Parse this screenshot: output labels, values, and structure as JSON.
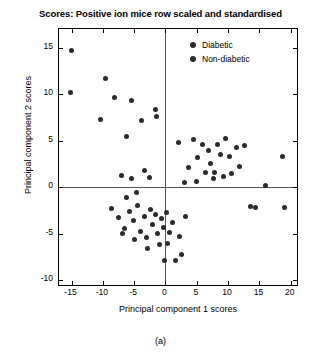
{
  "chart_data": {
    "type": "scatter",
    "title": "Scores: Positive ion mice row scaled and standardised",
    "xlabel": "Principal component 1 scores",
    "ylabel": "Principal component 2 scores",
    "xlim": [
      -17,
      21
    ],
    "ylim": [
      -10.5,
      17
    ],
    "xticks": [
      -15,
      -10,
      -5,
      0,
      5,
      10,
      15,
      20
    ],
    "yticks": [
      -10,
      -5,
      0,
      5,
      10,
      15
    ],
    "xticklabels": [
      "-15",
      "-10",
      "-5",
      "0",
      "5",
      "10",
      "15",
      "20"
    ],
    "yticklabels": [
      "-10",
      "-5",
      "0",
      "5",
      "10",
      "15"
    ],
    "grid": false,
    "reference_lines": {
      "x": 0,
      "y": 0
    },
    "legend": {
      "position": "top-right-inside",
      "entries": [
        {
          "name": "Diabetic",
          "color": "#2b2b2b",
          "marker": "circle"
        },
        {
          "name": "Non-diabetic",
          "color": "#2b2b2b",
          "marker": "circle"
        }
      ]
    },
    "series": [
      {
        "name": "Diabetic",
        "color": "#2b2b2b",
        "points": [
          [
            -15.0,
            14.7
          ],
          [
            -15.1,
            10.2
          ],
          [
            -9.6,
            11.7
          ],
          [
            -8.2,
            9.6
          ],
          [
            -10.3,
            7.3
          ],
          [
            -5.4,
            9.3
          ],
          [
            -3.9,
            7.2
          ],
          [
            -1.6,
            8.4
          ],
          [
            -1.4,
            7.6
          ],
          [
            -6.2,
            5.5
          ],
          [
            -7.1,
            1.3
          ],
          [
            -5.5,
            0.9
          ],
          [
            -3.3,
            1.8
          ],
          [
            -2.6,
            1.0
          ],
          [
            -4.7,
            -0.6
          ],
          [
            -6.3,
            -1.1
          ],
          [
            -8.6,
            -2.3
          ],
          [
            -7.5,
            -3.2
          ],
          [
            -6.6,
            -4.4
          ],
          [
            -5.8,
            -2.6
          ],
          [
            -5.1,
            -3.6
          ],
          [
            -4.4,
            -2.0
          ],
          [
            -4.0,
            -4.7
          ],
          [
            -3.4,
            -3.1
          ],
          [
            -3.0,
            -5.4
          ],
          [
            -2.4,
            -2.4
          ],
          [
            -2.0,
            -4.0
          ],
          [
            -1.6,
            -2.9
          ],
          [
            -1.2,
            -5.0
          ],
          [
            -0.7,
            -3.4
          ],
          [
            -0.3,
            -4.3
          ],
          [
            0.2,
            -2.7
          ],
          [
            0.6,
            -4.9
          ],
          [
            1.1,
            -3.8
          ],
          [
            -5.0,
            -5.6
          ],
          [
            -6.9,
            -5.0
          ],
          [
            -2.9,
            -6.6
          ],
          [
            -1.0,
            -6.2
          ],
          [
            0.4,
            -6.0
          ],
          [
            1.6,
            -7.9
          ],
          [
            2.3,
            -5.3
          ],
          [
            2.6,
            -7.2
          ],
          [
            -0.2,
            -7.9
          ]
        ]
      },
      {
        "name": "Non-diabetic",
        "color": "#2b2b2b",
        "points": [
          [
            2.0,
            4.8
          ],
          [
            3.6,
            2.1
          ],
          [
            4.4,
            5.1
          ],
          [
            5.1,
            3.2
          ],
          [
            5.9,
            4.6
          ],
          [
            6.4,
            1.6
          ],
          [
            6.8,
            3.9
          ],
          [
            7.2,
            2.6
          ],
          [
            7.6,
            0.9
          ],
          [
            7.9,
            1.6
          ],
          [
            8.3,
            4.6
          ],
          [
            8.8,
            3.5
          ],
          [
            9.2,
            1.2
          ],
          [
            9.6,
            5.2
          ],
          [
            10.2,
            3.3
          ],
          [
            10.6,
            1.5
          ],
          [
            11.3,
            4.3
          ],
          [
            11.8,
            2.2
          ],
          [
            12.6,
            4.5
          ],
          [
            13.5,
            -2.1
          ],
          [
            14.4,
            -2.2
          ],
          [
            16.0,
            0.2
          ],
          [
            18.7,
            3.3
          ],
          [
            19.0,
            -2.2
          ],
          [
            3.2,
            -3.1
          ],
          [
            4.9,
            0.6
          ],
          [
            3.0,
            0.5
          ]
        ]
      }
    ]
  },
  "caption": "(a)"
}
